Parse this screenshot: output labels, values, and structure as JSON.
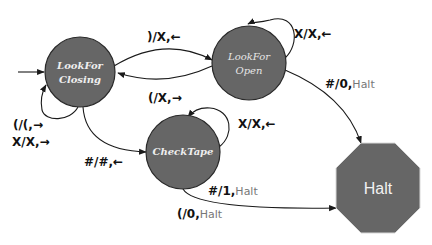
{
  "diagram": {
    "type": "state-machine",
    "colors": {
      "state_fill": "#666666",
      "state_stroke": "#2a2a2a",
      "edge": "#1a1a1a",
      "halt_fill": "#666666",
      "halt_text_gray": "#777777"
    },
    "states": [
      {
        "id": "lookfor-closing",
        "line1": "LookFor",
        "line2": "Closing",
        "start": true
      },
      {
        "id": "lookfor-open",
        "line1": "LookFor",
        "line2": "Open"
      },
      {
        "id": "checktape",
        "label": "CheckTape"
      },
      {
        "id": "halt",
        "label": "Halt",
        "shape": "octagon"
      }
    ],
    "transitions": [
      {
        "from": "lookfor-closing",
        "to": "lookfor-open",
        "bold": ")/X,",
        "arrow": "←",
        "rest": ""
      },
      {
        "from": "lookfor-open",
        "to": "lookfor-closing",
        "bold": "(/X,",
        "arrow": "→",
        "rest": ""
      },
      {
        "from": "lookfor-open",
        "to": "lookfor-open",
        "bold": "X/X,",
        "arrow": "←",
        "rest": ""
      },
      {
        "from": "lookfor-open",
        "to": "halt",
        "bold": "#/0,",
        "arrow": "",
        "rest": "Halt"
      },
      {
        "from": "lookfor-closing",
        "to": "lookfor-closing",
        "line1": "(/(,→",
        "line2": "X/X,→"
      },
      {
        "from": "lookfor-closing",
        "to": "checktape",
        "bold": "#/#,",
        "arrow": "←",
        "rest": ""
      },
      {
        "from": "checktape",
        "to": "checktape",
        "bold": "X/X,",
        "arrow": "←",
        "rest": ""
      },
      {
        "from": "checktape",
        "to": "halt",
        "bold": "#/1,",
        "arrow": "",
        "rest": "Halt"
      },
      {
        "from": "checktape",
        "to": "halt",
        "bold": "(/0,",
        "arrow": "",
        "rest": "Halt"
      }
    ]
  }
}
